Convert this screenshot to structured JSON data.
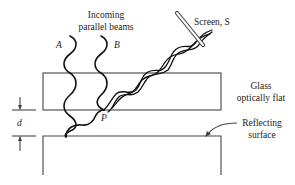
{
  "diagram": {
    "labels": {
      "incoming_line1": "Incoming",
      "incoming_line2": "parallel beams",
      "beam_a": "A",
      "beam_b": "B",
      "screen": "Screen, S",
      "glass_line1": "Glass",
      "glass_line2": "optically flat",
      "reflecting_line1": "Reflecting",
      "reflecting_line2": "surface",
      "point_p": "P",
      "gap_d": "d"
    },
    "colors": {
      "lines": "#444444",
      "waves": "#111111",
      "background": "#ffffff"
    }
  }
}
